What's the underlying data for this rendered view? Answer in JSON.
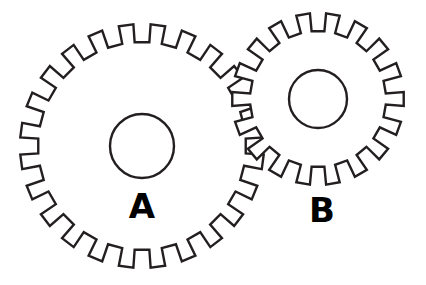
{
  "figure": {
    "background_color": "#ffffff",
    "stroke_color": "#231f20",
    "label_color": "#000000",
    "width": 426,
    "height": 285
  },
  "gears": [
    {
      "id": "gear-a",
      "label": "A",
      "label_x": 142,
      "label_y": 218,
      "label_size": 34,
      "teeth": 24,
      "center_x": 142,
      "center_y": 146,
      "outer_radius": 122,
      "root_radius": 104,
      "hub_radius": 32,
      "tooth_top_fraction": 0.46,
      "phase_deg": 7.5
    },
    {
      "id": "gear-b",
      "label": "B",
      "label_x": 322,
      "label_y": 222,
      "label_size": 34,
      "teeth": 18,
      "center_x": 318,
      "center_y": 99,
      "outer_radius": 86,
      "root_radius": 68,
      "hub_radius": 29,
      "tooth_top_fraction": 0.46,
      "phase_deg": 10
    }
  ],
  "chart_data": {
    "type": "diagram",
    "items": [
      {
        "name": "A",
        "teeth": 24,
        "outer_radius_px": 122,
        "hub_radius_px": 32
      },
      {
        "name": "B",
        "teeth": 18,
        "outer_radius_px": 86,
        "hub_radius_px": 29
      }
    ],
    "annotations": [
      "A",
      "B"
    ]
  }
}
